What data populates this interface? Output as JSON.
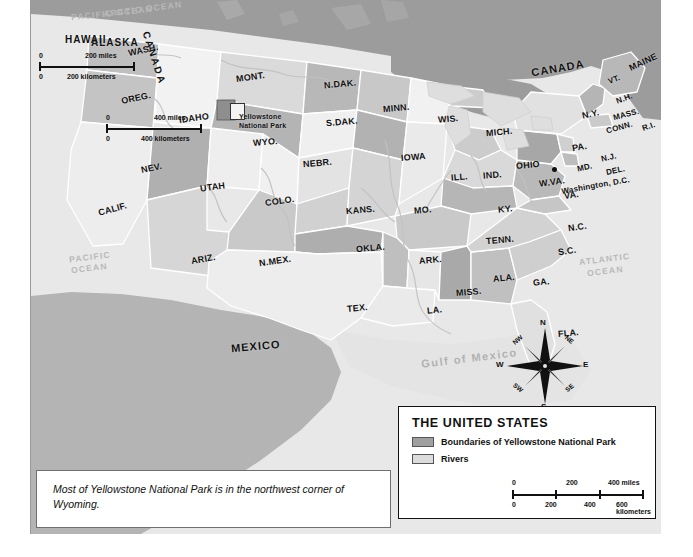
{
  "map": {
    "title": "THE UNITED STATES",
    "countries": [
      {
        "name": "CANADA",
        "x": 500,
        "y": 62,
        "rot": "r-10"
      },
      {
        "name": "MEXICO",
        "x": 200,
        "y": 340,
        "rot": "r-5"
      }
    ],
    "oceans": [
      {
        "name": "PACIFIC",
        "x": 38,
        "y": 252,
        "cls": "ocean"
      },
      {
        "name": "OCEAN",
        "x": 40,
        "y": 263,
        "cls": "ocean"
      },
      {
        "name": "ATLANTIC",
        "x": 548,
        "y": 254,
        "cls": "ocean"
      },
      {
        "name": "OCEAN",
        "x": 556,
        "y": 266,
        "cls": "ocean"
      },
      {
        "name": "Gulf of Mexico",
        "x": 390,
        "y": 352,
        "cls": "gulf"
      }
    ],
    "states": [
      {
        "label": "WASH.",
        "x": 97,
        "y": 45,
        "size": "state",
        "rot": "r-12"
      },
      {
        "label": "OREG.",
        "x": 90,
        "y": 93,
        "size": "state",
        "rot": "r-12"
      },
      {
        "label": "CALIF.",
        "x": 67,
        "y": 204,
        "size": "state",
        "rot": "r-15"
      },
      {
        "label": "IDAHO",
        "x": 148,
        "y": 113,
        "size": "state",
        "rot": "r-8"
      },
      {
        "label": "NEV.",
        "x": 110,
        "y": 163,
        "size": "state",
        "rot": "r-12"
      },
      {
        "label": "UTAH",
        "x": 169,
        "y": 182,
        "size": "state",
        "rot": "r-8"
      },
      {
        "label": "ARIZ.",
        "x": 160,
        "y": 254,
        "size": "state",
        "rot": "r-10"
      },
      {
        "label": "MONT.",
        "x": 205,
        "y": 72,
        "size": "state",
        "rot": "r-8"
      },
      {
        "label": "WYO.",
        "x": 222,
        "y": 137,
        "size": "state",
        "rot": "r-5"
      },
      {
        "label": "COLO.",
        "x": 234,
        "y": 196,
        "size": "state",
        "rot": "r-8"
      },
      {
        "label": "N.MEX.",
        "x": 228,
        "y": 256,
        "size": "state",
        "rot": "r-8"
      },
      {
        "label": "N.DAK.",
        "x": 293,
        "y": 79,
        "size": "state",
        "rot": "r-5"
      },
      {
        "label": "S.DAK.",
        "x": 295,
        "y": 117,
        "size": "state",
        "rot": "r-5"
      },
      {
        "label": "NEBR.",
        "x": 272,
        "y": 158,
        "size": "state",
        "rot": "r-5"
      },
      {
        "label": "KANS.",
        "x": 315,
        "y": 205,
        "size": "state",
        "rot": "r-5"
      },
      {
        "label": "OKLA.",
        "x": 325,
        "y": 243,
        "size": "state",
        "rot": "r-5"
      },
      {
        "label": "TEX.",
        "x": 316,
        "y": 303,
        "size": "state",
        "rot": "r-5"
      },
      {
        "label": "MINN.",
        "x": 352,
        "y": 103,
        "size": "state",
        "rot": "r-5"
      },
      {
        "label": "IOWA",
        "x": 370,
        "y": 152,
        "size": "state",
        "rot": "r-5"
      },
      {
        "label": "MO.",
        "x": 383,
        "y": 205,
        "size": "state",
        "rot": "r-5"
      },
      {
        "label": "ARK.",
        "x": 388,
        "y": 255,
        "size": "state",
        "rot": "r-5"
      },
      {
        "label": "LA.",
        "x": 396,
        "y": 305,
        "size": "state",
        "rot": "r-5"
      },
      {
        "label": "WIS.",
        "x": 407,
        "y": 114,
        "size": "state",
        "rot": "r-5"
      },
      {
        "label": "ILL.",
        "x": 420,
        "y": 172,
        "size": "state",
        "rot": "r-5"
      },
      {
        "label": "MISS.",
        "x": 425,
        "y": 287,
        "size": "state",
        "rot": "r-5"
      },
      {
        "label": "MICH.",
        "x": 455,
        "y": 127,
        "size": "state",
        "rot": "r-5"
      },
      {
        "label": "IND.",
        "x": 452,
        "y": 170,
        "size": "state",
        "rot": "r-5"
      },
      {
        "label": "OHIO",
        "x": 485,
        "y": 160,
        "size": "state",
        "rot": "r-5"
      },
      {
        "label": "KY.",
        "x": 467,
        "y": 204,
        "size": "state",
        "rot": "r-5"
      },
      {
        "label": "TENN.",
        "x": 455,
        "y": 235,
        "size": "state",
        "rot": "r-5"
      },
      {
        "label": "ALA.",
        "x": 462,
        "y": 273,
        "size": "state",
        "rot": "r-5"
      },
      {
        "label": "GA.",
        "x": 502,
        "y": 277,
        "size": "state",
        "rot": "r-5"
      },
      {
        "label": "FLA.",
        "x": 527,
        "y": 328,
        "size": "state",
        "rot": "r-5"
      },
      {
        "label": "S.C.",
        "x": 527,
        "y": 246,
        "size": "state",
        "rot": "r-8"
      },
      {
        "label": "N.C.",
        "x": 537,
        "y": 222,
        "size": "state",
        "rot": "r-8"
      },
      {
        "label": "VA.",
        "x": 533,
        "y": 190,
        "size": "state",
        "rot": "r-8"
      },
      {
        "label": "W.VA.",
        "x": 508,
        "y": 177,
        "size": "state",
        "rot": "r-8"
      },
      {
        "label": "PA.",
        "x": 541,
        "y": 142,
        "size": "state",
        "rot": "r-10"
      },
      {
        "label": "N.Y.",
        "x": 551,
        "y": 109,
        "size": "state",
        "rot": "r-12"
      },
      {
        "label": "MD.",
        "x": 546,
        "y": 163,
        "size": "state sm",
        "rot": "r-12"
      },
      {
        "label": "DEL.",
        "x": 575,
        "y": 166,
        "size": "state sm",
        "rot": "r-12"
      },
      {
        "label": "N.J.",
        "x": 570,
        "y": 153,
        "size": "state sm",
        "rot": "r-12"
      },
      {
        "label": "CONN.",
        "x": 575,
        "y": 123,
        "size": "state sm",
        "rot": "r-15"
      },
      {
        "label": "R.I.",
        "x": 611,
        "y": 122,
        "size": "state sm",
        "rot": "r-20"
      },
      {
        "label": "MASS.",
        "x": 582,
        "y": 110,
        "size": "state sm",
        "rot": "r-15"
      },
      {
        "label": "N.H.",
        "x": 585,
        "y": 94,
        "size": "state sm",
        "rot": "r-20"
      },
      {
        "label": "VT.",
        "x": 577,
        "y": 75,
        "size": "state sm",
        "rot": "r-20"
      },
      {
        "label": "MAINE",
        "x": 597,
        "y": 57,
        "size": "state",
        "rot": "r-25"
      }
    ],
    "city": {
      "label": "Washington, D.C.",
      "x": 530,
      "y": 181,
      "rot": "r-10"
    },
    "park_callout": {
      "line1": "Yellowstone",
      "line2": "National Park",
      "x": 208,
      "y": 113
    }
  },
  "alaska_inset": {
    "ocean_label": "ARCTIC OCEAN",
    "region": "ALASKA",
    "neighbor": "CANADA",
    "scale": {
      "miles_label": "400 miles",
      "km_label": "400 kilometers",
      "zero": "0",
      "miles_ticks": [
        "0",
        "400"
      ],
      "km_ticks": [
        "0",
        "400"
      ]
    }
  },
  "hawaii_inset": {
    "ocean_label": "PACIFIC OCEAN",
    "region": "HAWAII",
    "scale": {
      "miles_label": "200 miles",
      "km_label": "200 kilometers",
      "zero": "0"
    }
  },
  "legend": {
    "title": "THE UNITED STATES",
    "items": [
      {
        "label": "Boundaries of Yellowstone National Park",
        "color": "#a0a0a0"
      },
      {
        "label": "Rivers",
        "color": "#dcdcdc"
      }
    ],
    "scale": {
      "miles_unit": "400 miles",
      "km_unit": "600 kilometers",
      "miles_ticks": [
        "0",
        "200"
      ],
      "km_ticks": [
        "0",
        "200",
        "400"
      ]
    }
  },
  "compass": {
    "n": "N",
    "ne": "NE",
    "e": "E",
    "se": "SE",
    "s": "S",
    "sw": "SW",
    "w": "W",
    "nw": "NW"
  },
  "caption": {
    "text": "Most of Yellowstone National Park is in the northwest corner of Wyoming."
  },
  "colors": {
    "land_light": "#f0f0f0",
    "land_mid": "#d2d2d2",
    "land_dark": "#a8a8a8",
    "water": "#e6e6e6",
    "canada": "#9e9e9e",
    "border": "#ffffff"
  }
}
